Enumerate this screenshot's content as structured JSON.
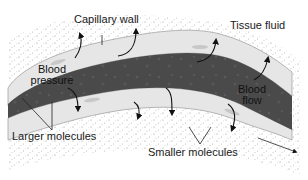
{
  "diagram": {
    "labels": {
      "capillary_wall": "Capillary wall",
      "tissue_fluid": "Tissue fluid",
      "blood_pressure_line1": "Blood",
      "blood_pressure_line2": "pressure",
      "blood_flow_line1": "Blood",
      "blood_flow_line2": "flow",
      "larger_molecules": "Larger molecules",
      "smaller_molecules": "Smaller molecules"
    },
    "colors": {
      "blood": "#4a4a4a",
      "wall": "#e6e6e6",
      "tissue_dots": "#9a9a9a",
      "arrow": "#111111"
    },
    "icons": {
      "arrow": "curved-arrow-icon"
    }
  }
}
